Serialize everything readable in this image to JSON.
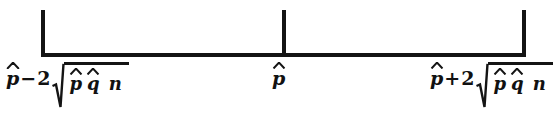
{
  "figure": {
    "type": "confidence-interval-number-line",
    "background_color": "#ffffff",
    "ink_color": "#141414",
    "endpoints": {
      "left": {
        "base_symbol": "p",
        "base_accent": "hat",
        "operator": "−",
        "coefficient": "2",
        "radicand_numerator_first": "p",
        "radicand_numerator_second": "q",
        "radicand_denominator": "n",
        "expression_plain": "p̂ − 2√(p̂q̂/n)"
      },
      "center": {
        "base_symbol": "p",
        "base_accent": "hat",
        "expression_plain": "p̂"
      },
      "right": {
        "base_symbol": "p",
        "base_accent": "hat",
        "operator": "+",
        "coefficient": "2",
        "radicand_numerator_first": "p",
        "radicand_numerator_second": "q",
        "radicand_denominator": "n",
        "expression_plain": "p̂ + 2√(p̂q̂/n)"
      }
    },
    "tick_count": "3"
  }
}
